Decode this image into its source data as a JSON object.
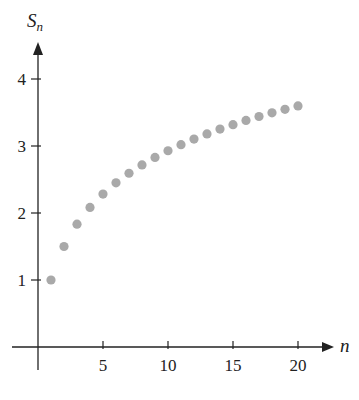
{
  "chart_data": {
    "type": "scatter",
    "title": "",
    "xlabel": "n",
    "ylabel": "S_n",
    "ylabel_main": "S",
    "ylabel_sub": "n",
    "x": [
      1,
      2,
      3,
      4,
      5,
      6,
      7,
      8,
      9,
      10,
      11,
      12,
      13,
      14,
      15,
      16,
      17,
      18,
      19,
      20
    ],
    "y": [
      1.0,
      1.5,
      1.833,
      2.083,
      2.283,
      2.45,
      2.593,
      2.718,
      2.829,
      2.929,
      3.02,
      3.103,
      3.18,
      3.252,
      3.318,
      3.381,
      3.44,
      3.495,
      3.548,
      3.598
    ],
    "xticks": [
      5,
      10,
      15,
      20
    ],
    "xtick_labels": [
      "5",
      "10",
      "15",
      "20"
    ],
    "yticks": [
      1,
      2,
      3,
      4
    ],
    "ytick_labels": [
      "1",
      "2",
      "3",
      "4"
    ],
    "xlim": [
      -2,
      22.5
    ],
    "ylim": [
      -1,
      4.6
    ],
    "grid": false,
    "legend": null,
    "marker_color": "#a9a9a9",
    "axis_color": "#222222"
  }
}
